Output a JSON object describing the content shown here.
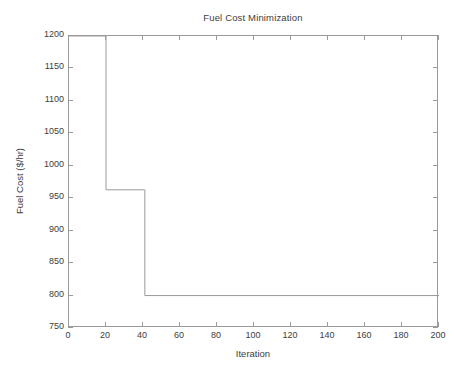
{
  "chart_data": {
    "type": "line",
    "title": "Fuel Cost Minimization",
    "xlabel": "Iteration",
    "ylabel": "Fuel Cost ($/hr)",
    "xlim": [
      0,
      200
    ],
    "ylim": [
      750,
      1200
    ],
    "xticks": [
      0,
      20,
      40,
      60,
      80,
      100,
      120,
      140,
      160,
      180,
      200
    ],
    "yticks": [
      750,
      800,
      850,
      900,
      950,
      1000,
      1050,
      1100,
      1150,
      1200
    ],
    "grid": false,
    "legend": null,
    "line_color": "#9a9a9a",
    "series": [
      {
        "name": "Fuel Cost",
        "step": "post",
        "x": [
          0,
          20,
          20,
          41,
          41,
          200
        ],
        "y": [
          1200,
          1200,
          963,
          963,
          800,
          800
        ],
        "breakpoints": [
          {
            "iteration": 0,
            "cost": 1200
          },
          {
            "iteration": 20,
            "cost": 963
          },
          {
            "iteration": 41,
            "cost": 800
          },
          {
            "iteration": 200,
            "cost": 800
          }
        ]
      }
    ],
    "annotations": []
  },
  "figure": {
    "background": "#ffffff",
    "axis_color": "#9a9a9a",
    "text_color": "#3d3d3d"
  }
}
